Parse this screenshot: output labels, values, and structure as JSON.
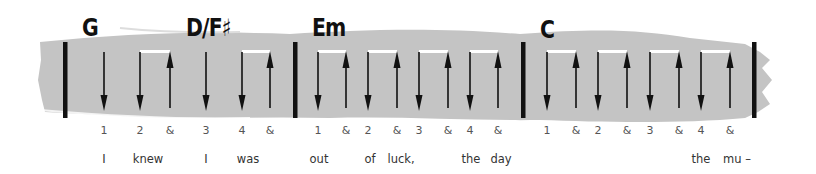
{
  "colors": {
    "band": "#c4c4c4",
    "ink": "#111111",
    "beat": "#555555",
    "lyric": "#333333",
    "tie": "#ffffff"
  },
  "chords": [
    {
      "label": "G",
      "x": 82,
      "y": 16
    },
    {
      "label": "D/F♯",
      "x": 186,
      "y": 16
    },
    {
      "label": "Em",
      "x": 312,
      "y": 16
    },
    {
      "label": "C",
      "x": 540,
      "y": 18
    }
  ],
  "barlines": [
    65,
    295,
    523,
    754
  ],
  "strokes": [
    {
      "dir": "down",
      "x": 104
    },
    {
      "dir": "down",
      "x": 140,
      "tie_to": 170
    },
    {
      "dir": "up",
      "x": 170
    },
    {
      "dir": "down",
      "x": 206
    },
    {
      "dir": "down",
      "x": 242,
      "tie_to": 270
    },
    {
      "dir": "up",
      "x": 270
    },
    {
      "dir": "down",
      "x": 318,
      "tie_to": 346
    },
    {
      "dir": "up",
      "x": 346
    },
    {
      "dir": "down",
      "x": 368,
      "tie_to": 397
    },
    {
      "dir": "up",
      "x": 397
    },
    {
      "dir": "down",
      "x": 419,
      "tie_to": 448
    },
    {
      "dir": "up",
      "x": 448
    },
    {
      "dir": "down",
      "x": 470,
      "tie_to": 498
    },
    {
      "dir": "up",
      "x": 498
    },
    {
      "dir": "down",
      "x": 547,
      "tie_to": 576
    },
    {
      "dir": "up",
      "x": 576
    },
    {
      "dir": "down",
      "x": 598,
      "tie_to": 627
    },
    {
      "dir": "up",
      "x": 627
    },
    {
      "dir": "down",
      "x": 650,
      "tie_to": 679
    },
    {
      "dir": "up",
      "x": 679
    },
    {
      "dir": "down",
      "x": 701,
      "tie_to": 730
    },
    {
      "dir": "up",
      "x": 730
    }
  ],
  "beats": [
    {
      "label": "1",
      "x": 104
    },
    {
      "label": "2",
      "x": 140
    },
    {
      "label": "&",
      "x": 170
    },
    {
      "label": "3",
      "x": 206
    },
    {
      "label": "4",
      "x": 242
    },
    {
      "label": "&",
      "x": 270
    },
    {
      "label": "1",
      "x": 318
    },
    {
      "label": "&",
      "x": 346
    },
    {
      "label": "2",
      "x": 368
    },
    {
      "label": "&",
      "x": 397
    },
    {
      "label": "3",
      "x": 419
    },
    {
      "label": "&",
      "x": 448
    },
    {
      "label": "4",
      "x": 470
    },
    {
      "label": "&",
      "x": 498
    },
    {
      "label": "1",
      "x": 547
    },
    {
      "label": "&",
      "x": 576
    },
    {
      "label": "2",
      "x": 598
    },
    {
      "label": "&",
      "x": 627
    },
    {
      "label": "3",
      "x": 650
    },
    {
      "label": "&",
      "x": 679
    },
    {
      "label": "4",
      "x": 701
    },
    {
      "label": "&",
      "x": 730
    }
  ],
  "lyrics": [
    {
      "text": "I",
      "x": 104
    },
    {
      "text": "knew",
      "x": 148
    },
    {
      "text": "I",
      "x": 206
    },
    {
      "text": "was",
      "x": 248
    },
    {
      "text": "out",
      "x": 319
    },
    {
      "text": "of",
      "x": 370
    },
    {
      "text": "luck,",
      "x": 401
    },
    {
      "text": "the",
      "x": 471
    },
    {
      "text": "day",
      "x": 501
    },
    {
      "text": "the",
      "x": 701
    },
    {
      "text": "mu –",
      "x": 737
    }
  ]
}
